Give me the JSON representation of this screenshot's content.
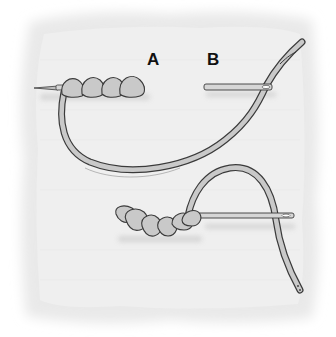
{
  "diagram": {
    "labels": {
      "a": "A",
      "b": "B"
    },
    "colors": {
      "background": "#ffffff",
      "fabric": "#ececec",
      "fabric_edge": "#f6f6f6",
      "thread_fill": "#c9c9c9",
      "thread_outline": "#3a3a3a",
      "needle_fill": "#d6d6d6",
      "label": "#111111"
    },
    "parts": [
      "fabric-swatch",
      "needle-a-with-wraps",
      "needle-b",
      "working-thread-top",
      "finished-knot-bottom",
      "needle-bottom",
      "working-thread-bottom"
    ]
  }
}
